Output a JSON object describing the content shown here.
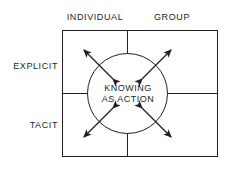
{
  "diagram": {
    "columns": [
      {
        "id": "individual",
        "label": "INDIVIDUAL"
      },
      {
        "id": "group",
        "label": "GROUP"
      }
    ],
    "rows": [
      {
        "id": "explicit",
        "label": "EXPLICIT"
      },
      {
        "id": "tacit",
        "label": "TACIT"
      }
    ],
    "center": {
      "line1": "KNOWING",
      "line2": "AS ACTION"
    },
    "arrows": [
      {
        "id": "upper-left",
        "direction": "up-left / down-right",
        "heads": 2
      },
      {
        "id": "upper-right",
        "direction": "up-right / down-left",
        "heads": 2
      },
      {
        "id": "lower-left",
        "direction": "down-left / up-right",
        "heads": 2
      },
      {
        "id": "lower-right",
        "direction": "down-right / up-left",
        "heads": 2
      }
    ],
    "colors": {
      "stroke": "#231f20",
      "text": "#231f20",
      "background": "#ffffff"
    }
  }
}
